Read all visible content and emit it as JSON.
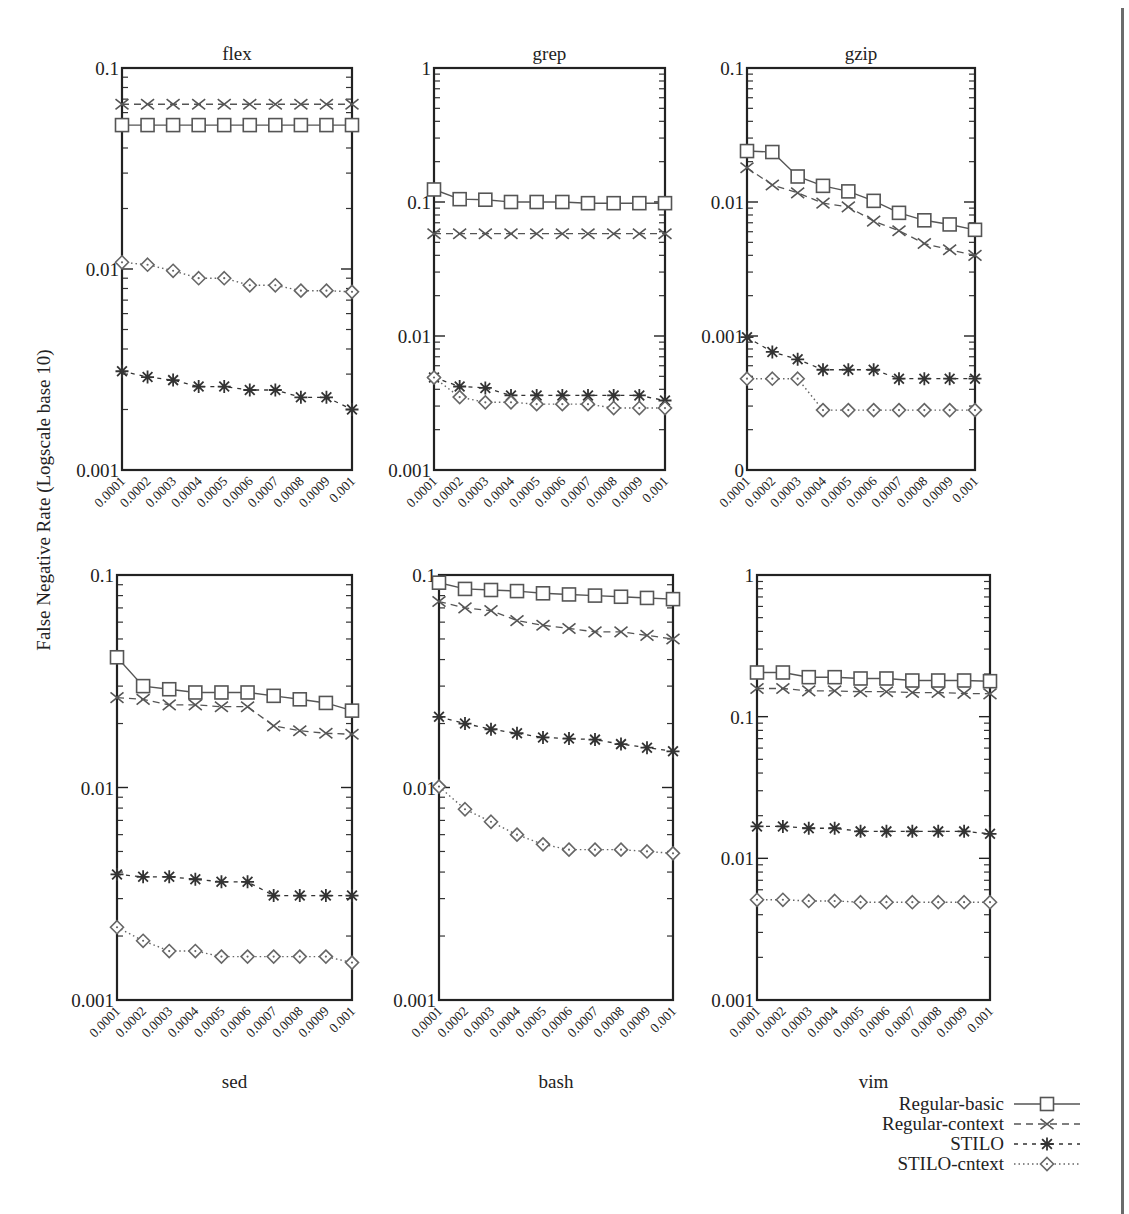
{
  "figure": {
    "ylabel": "False Negative Rate (Logscale base 10)"
  },
  "legend": {
    "entries": [
      {
        "label": "Regular-basic",
        "marker": "square",
        "dash": "solid"
      },
      {
        "label": "Regular-context",
        "marker": "x",
        "dash": "dashed"
      },
      {
        "label": "STILO",
        "marker": "star",
        "dash": "dashdot"
      },
      {
        "label": "STILO-cntext",
        "marker": "diamond",
        "dash": "dotted"
      }
    ]
  },
  "chart_data": [
    {
      "type": "line",
      "title": "flex",
      "title_pos": "top",
      "xlabel": "",
      "ylabel": "False Negative Rate (Logscale base 10)",
      "yscale": "log",
      "ylim": [
        0.001,
        0.1
      ],
      "ytick_labels": [
        "0.1",
        "0.01",
        "0.001"
      ],
      "ytick_values": [
        0.1,
        0.01,
        0.001
      ],
      "categories": [
        "0.0001",
        "0.0002",
        "0.0003",
        "0.0004",
        "0.0005",
        "0.0006",
        "0.0007",
        "0.0008",
        "0.0009",
        "0.001"
      ],
      "series": [
        {
          "name": "Regular-basic",
          "values": [
            0.052,
            0.052,
            0.052,
            0.052,
            0.052,
            0.052,
            0.052,
            0.052,
            0.052,
            0.052
          ]
        },
        {
          "name": "Regular-context",
          "values": [
            0.066,
            0.066,
            0.066,
            0.066,
            0.066,
            0.066,
            0.066,
            0.066,
            0.066,
            0.066
          ]
        },
        {
          "name": "STILO",
          "values": [
            0.0031,
            0.0029,
            0.0028,
            0.0026,
            0.0026,
            0.0025,
            0.0025,
            0.0023,
            0.0023,
            0.002
          ]
        },
        {
          "name": "STILO-cntext",
          "values": [
            0.0108,
            0.0105,
            0.0098,
            0.009,
            0.009,
            0.0083,
            0.0083,
            0.0078,
            0.0078,
            0.0077
          ]
        }
      ]
    },
    {
      "type": "line",
      "title": "grep",
      "title_pos": "top",
      "xlabel": "",
      "ylabel": "",
      "yscale": "log",
      "ylim": [
        0.001,
        1
      ],
      "ytick_labels": [
        "1",
        "0.1",
        "0.01",
        "0.001"
      ],
      "ytick_values": [
        1,
        0.1,
        0.01,
        0.001
      ],
      "categories": [
        "0.0001",
        "0.0002",
        "0.0003",
        "0.0004",
        "0.0005",
        "0.0006",
        "0.0007",
        "0.0008",
        "0.0009",
        "0.001"
      ],
      "series": [
        {
          "name": "Regular-basic",
          "values": [
            0.124,
            0.105,
            0.104,
            0.1,
            0.1,
            0.1,
            0.098,
            0.098,
            0.098,
            0.098
          ]
        },
        {
          "name": "Regular-context",
          "values": [
            0.058,
            0.058,
            0.058,
            0.058,
            0.058,
            0.058,
            0.058,
            0.058,
            0.058,
            0.058
          ]
        },
        {
          "name": "STILO",
          "values": [
            0.0049,
            0.0042,
            0.0041,
            0.0036,
            0.0036,
            0.0036,
            0.0036,
            0.0036,
            0.0036,
            0.0033
          ]
        },
        {
          "name": "STILO-cntext",
          "values": [
            0.0049,
            0.0035,
            0.0032,
            0.0032,
            0.0031,
            0.0031,
            0.0031,
            0.0029,
            0.0029,
            0.0029
          ]
        }
      ]
    },
    {
      "type": "line",
      "title": "gzip",
      "title_pos": "top",
      "xlabel": "",
      "ylabel": "",
      "yscale": "log",
      "ylim": [
        0.0001,
        0.1
      ],
      "ytick_labels": [
        "0.1",
        "0.01",
        "0.001",
        "0"
      ],
      "ytick_values": [
        0.1,
        0.01,
        0.001,
        0.0001
      ],
      "categories": [
        "0.0001",
        "0.0002",
        "0.0003",
        "0.0004",
        "0.0005",
        "0.0006",
        "0.0007",
        "0.0008",
        "0.0009",
        "0.001"
      ],
      "series": [
        {
          "name": "Regular-basic",
          "values": [
            0.024,
            0.0236,
            0.0155,
            0.0132,
            0.012,
            0.0102,
            0.0083,
            0.0073,
            0.0068,
            0.0062
          ]
        },
        {
          "name": "Regular-context",
          "values": [
            0.018,
            0.0134,
            0.0117,
            0.0098,
            0.0092,
            0.0072,
            0.0061,
            0.0049,
            0.0044,
            0.004
          ]
        },
        {
          "name": "STILO",
          "values": [
            0.00098,
            0.00076,
            0.00067,
            0.00056,
            0.00056,
            0.00056,
            0.00048,
            0.00048,
            0.00048,
            0.00048
          ]
        },
        {
          "name": "STILO-cntext",
          "values": [
            0.00048,
            0.00048,
            0.00048,
            0.00028,
            0.00028,
            0.00028,
            0.00028,
            0.00028,
            0.00028,
            0.00028
          ]
        }
      ]
    },
    {
      "type": "line",
      "title": "sed",
      "title_pos": "bottom",
      "xlabel": "",
      "ylabel": "",
      "yscale": "log",
      "ylim": [
        0.001,
        0.1
      ],
      "ytick_labels": [
        "0.1",
        "0.01",
        "0.001"
      ],
      "ytick_values": [
        0.1,
        0.01,
        0.001
      ],
      "categories": [
        "0.0001",
        "0.0002",
        "0.0003",
        "0.0004",
        "0.0005",
        "0.0006",
        "0.0007",
        "0.0008",
        "0.0009",
        "0.001"
      ],
      "series": [
        {
          "name": "Regular-basic",
          "values": [
            0.041,
            0.03,
            0.029,
            0.028,
            0.028,
            0.028,
            0.027,
            0.026,
            0.025,
            0.023
          ]
        },
        {
          "name": "Regular-context",
          "values": [
            0.0265,
            0.026,
            0.0245,
            0.0245,
            0.024,
            0.024,
            0.0195,
            0.0185,
            0.018,
            0.0178
          ]
        },
        {
          "name": "STILO",
          "values": [
            0.0039,
            0.0038,
            0.0038,
            0.0037,
            0.0036,
            0.0036,
            0.0031,
            0.0031,
            0.0031,
            0.0031
          ]
        },
        {
          "name": "STILO-cntext",
          "values": [
            0.0022,
            0.0019,
            0.0017,
            0.0017,
            0.0016,
            0.0016,
            0.0016,
            0.0016,
            0.0016,
            0.0015
          ]
        }
      ]
    },
    {
      "type": "line",
      "title": "bash",
      "title_pos": "bottom",
      "xlabel": "",
      "ylabel": "",
      "yscale": "log",
      "ylim": [
        0.001,
        0.1
      ],
      "ytick_labels": [
        "0.1",
        "0.01",
        "0.001"
      ],
      "ytick_values": [
        0.1,
        0.01,
        0.001
      ],
      "categories": [
        "0.0001",
        "0.0002",
        "0.0003",
        "0.0004",
        "0.0005",
        "0.0006",
        "0.0007",
        "0.0008",
        "0.0009",
        "0.001"
      ],
      "series": [
        {
          "name": "Regular-basic",
          "values": [
            0.092,
            0.086,
            0.085,
            0.084,
            0.082,
            0.081,
            0.08,
            0.079,
            0.078,
            0.077
          ]
        },
        {
          "name": "Regular-context",
          "values": [
            0.075,
            0.07,
            0.068,
            0.061,
            0.058,
            0.056,
            0.054,
            0.054,
            0.052,
            0.05
          ]
        },
        {
          "name": "STILO",
          "values": [
            0.0215,
            0.02,
            0.0188,
            0.018,
            0.0172,
            0.017,
            0.0168,
            0.016,
            0.0154,
            0.0148
          ]
        },
        {
          "name": "STILO-cntext",
          "values": [
            0.0101,
            0.0079,
            0.0069,
            0.006,
            0.0054,
            0.0051,
            0.0051,
            0.0051,
            0.005,
            0.0049
          ]
        }
      ]
    },
    {
      "type": "line",
      "title": "vim",
      "title_pos": "bottom",
      "xlabel": "",
      "ylabel": "",
      "yscale": "log",
      "ylim": [
        0.001,
        1
      ],
      "ytick_labels": [
        "1",
        "0.1",
        "0.01",
        "0.001"
      ],
      "ytick_values": [
        1,
        0.1,
        0.01,
        0.001
      ],
      "categories": [
        "0.0001",
        "0.0002",
        "0.0003",
        "0.0004",
        "0.0005",
        "0.0006",
        "0.0007",
        "0.0008",
        "0.0009",
        "0.001"
      ],
      "series": [
        {
          "name": "Regular-basic",
          "values": [
            0.205,
            0.205,
            0.19,
            0.19,
            0.186,
            0.186,
            0.18,
            0.18,
            0.18,
            0.178
          ]
        },
        {
          "name": "Regular-context",
          "values": [
            0.158,
            0.158,
            0.152,
            0.152,
            0.15,
            0.15,
            0.148,
            0.148,
            0.146,
            0.145
          ]
        },
        {
          "name": "STILO",
          "values": [
            0.0168,
            0.0168,
            0.0163,
            0.0163,
            0.0155,
            0.0155,
            0.0155,
            0.0155,
            0.0155,
            0.0149
          ]
        },
        {
          "name": "STILO-cntext",
          "values": [
            0.0051,
            0.0051,
            0.005,
            0.005,
            0.0049,
            0.0049,
            0.0049,
            0.0049,
            0.0049,
            0.0049
          ]
        }
      ]
    }
  ]
}
